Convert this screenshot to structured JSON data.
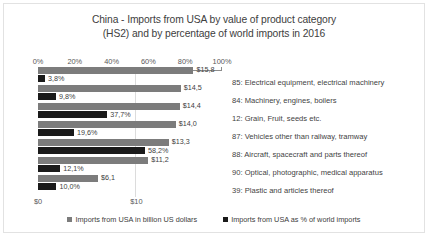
{
  "chart_data": {
    "type": "bar",
    "title": "China - Imports from USA by value of product category (HS2) and by percentage of world imports in 2016",
    "title_line1": "China - Imports from USA by value of product category",
    "title_line2": "(HS2) and by percentage of world imports in 2016",
    "orientation": "horizontal",
    "categories": [
      "85: Electrical equipment, electrical machinery",
      "84: Machinery, engines, boilers",
      "12: Grain, Fruit, seeds etc.",
      "87: Vehicles other than railway, tramway",
      "88: Aircraft, spacecraft and parts thereof",
      "90: Optical, photographic, medical apparatus",
      "39: Plastic and articles thereof"
    ],
    "series": [
      {
        "name": "Imports from USA in billion US dollars",
        "axis": "bottom",
        "unit": "billion US dollars",
        "color": "#7c7c7c",
        "values": [
          15.8,
          14.5,
          14.4,
          14.0,
          13.3,
          11.2,
          6.1
        ],
        "labels": [
          "$15,8",
          "$14,5",
          "$14,4",
          "$14,0",
          "$13,3",
          "$11,2",
          "$6,1"
        ]
      },
      {
        "name": "Imports from USA as % of world imports",
        "axis": "top",
        "unit": "%",
        "color": "#1a1a1a",
        "values": [
          3.8,
          9.8,
          37.7,
          19.6,
          58.2,
          12.1,
          10.0
        ],
        "labels": [
          "3,8%",
          "9,8%",
          "37,7%",
          "19,6%",
          "58,2%",
          "12,1%",
          "10,0%"
        ]
      }
    ],
    "top_axis": {
      "label": "",
      "ticks": [
        "0%",
        "20%",
        "40%",
        "60%",
        "80%",
        "100%"
      ],
      "tick_values": [
        0,
        20,
        40,
        60,
        80,
        100
      ],
      "range": [
        0,
        100
      ]
    },
    "bottom_axis": {
      "label": "",
      "ticks": [
        "$0",
        "$10"
      ],
      "tick_values": [
        0,
        10
      ],
      "range": [
        0,
        18.7
      ]
    },
    "grid": true,
    "legend_position": "bottom",
    "legend": [
      "Imports from USA in billion US dollars",
      "Imports from USA as % of world imports"
    ]
  }
}
